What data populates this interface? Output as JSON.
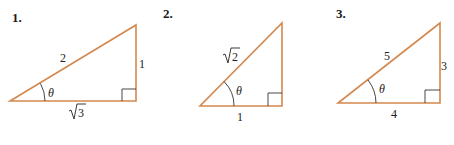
{
  "colors": {
    "triangle_stroke": "#d4884e",
    "text": "#222222"
  },
  "figures": [
    {
      "number": "1.",
      "hypotenuse": "2",
      "opposite": "1",
      "adjacent_radicand": "3",
      "adjacent": "√3",
      "angle": "θ"
    },
    {
      "number": "2.",
      "hypotenuse_radicand": "2",
      "hypotenuse": "√2",
      "opposite": "",
      "adjacent": "1",
      "angle": "θ"
    },
    {
      "number": "3.",
      "hypotenuse": "5",
      "opposite": "3",
      "adjacent": "4",
      "angle": "θ"
    }
  ]
}
